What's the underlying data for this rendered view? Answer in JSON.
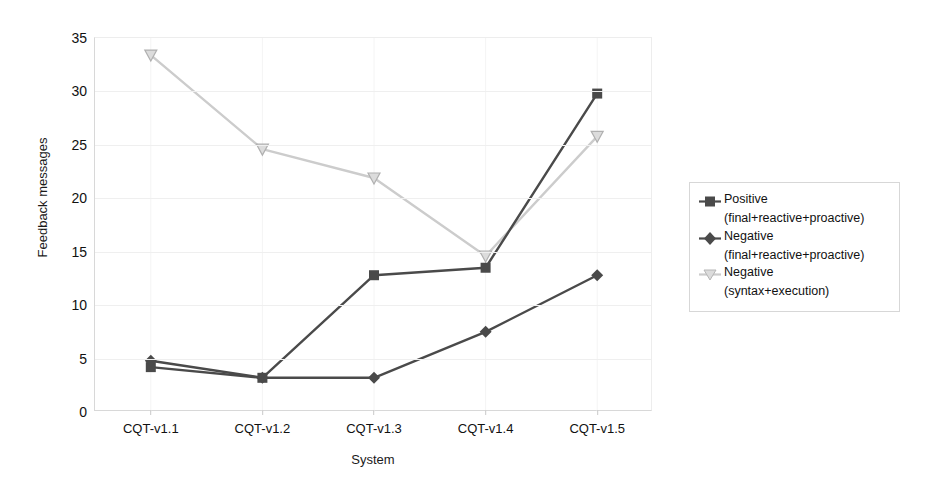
{
  "chart_data": {
    "type": "line",
    "title": "",
    "xlabel": "System",
    "ylabel": "Feedback messages",
    "categories": [
      "CQT-v1.1",
      "CQT-v1.2",
      "CQT-v1.3",
      "CQT-v1.4",
      "CQT-v1.5"
    ],
    "ylim": [
      0,
      35
    ],
    "yticks": [
      0,
      5,
      10,
      15,
      20,
      25,
      30,
      35
    ],
    "grid": true,
    "legend_position": "right",
    "series": [
      {
        "name": "Positive (final+reactive+proactive)",
        "name_line1": "Positive",
        "name_line2": "(final+reactive+proactive)",
        "marker": "square",
        "color": "#4a4a4a",
        "values": [
          4.2,
          3.2,
          12.8,
          13.5,
          29.8
        ]
      },
      {
        "name": "Negative (final+reactive+proactive)",
        "name_line1": "Negative",
        "name_line2": "(final+reactive+proactive)",
        "marker": "diamond",
        "color": "#4a4a4a",
        "values": [
          4.8,
          3.2,
          3.2,
          7.5,
          12.8
        ]
      },
      {
        "name": "Negative (syntax+execution)",
        "name_line1": "Negative",
        "name_line2": "(syntax+execution)",
        "marker": "triangle-down",
        "color": "#cccccc",
        "values": [
          33.4,
          24.6,
          21.9,
          14.6,
          25.8
        ]
      }
    ]
  },
  "colors": {
    "dark_series": "#4a4a4a",
    "light_series": "#cccccc",
    "gridline": "#efefef",
    "axis": "#d8d8d8",
    "legend_border": "#d7d7d7",
    "text": "#111111",
    "background": "#ffffff"
  }
}
